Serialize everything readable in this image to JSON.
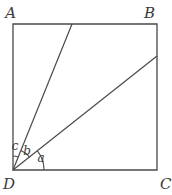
{
  "figure": {
    "kind": "plane-geometry-figure",
    "background_color": "#ffffff",
    "stroke_color": "#4a4a4a",
    "label_color": "#3a3a3a",
    "square": {
      "name": "square-abcd",
      "corners": {
        "A": {
          "x": 13,
          "y": 24
        },
        "B": {
          "x": 157,
          "y": 24
        },
        "C": {
          "x": 157,
          "y": 170
        },
        "D": {
          "x": 13,
          "y": 170
        }
      }
    },
    "vertex_labels": [
      {
        "key": "A",
        "text": "A",
        "x": 16,
        "y": 18,
        "anchor": "end"
      },
      {
        "key": "B",
        "text": "B",
        "x": 155,
        "y": 18,
        "anchor": "end"
      },
      {
        "key": "C",
        "text": "C",
        "x": 160,
        "y": 189,
        "anchor": "start"
      },
      {
        "key": "D",
        "text": "D",
        "x": 15,
        "y": 189,
        "anchor": "end"
      }
    ],
    "rays": [
      {
        "name": "ray-d-to-top-edge",
        "from": {
          "x": 13,
          "y": 170
        },
        "to": {
          "x": 72,
          "y": 24
        }
      },
      {
        "name": "ray-d-to-right-edge",
        "from": {
          "x": 13,
          "y": 170
        },
        "to": {
          "x": 157,
          "y": 56
        }
      }
    ],
    "angles": [
      {
        "key": "a",
        "text": "a",
        "name": "angle-a",
        "description": "angle between side DC and the ray from D to the right edge",
        "radius": 31,
        "start_deg": 0,
        "end_deg": 38,
        "label": {
          "x": 41,
          "y": 162
        }
      },
      {
        "key": "b",
        "text": "b",
        "name": "angle-b",
        "description": "angle between the two rays drawn from D",
        "radius": 21,
        "start_deg": 38,
        "end_deg": 68,
        "label": {
          "x": 27,
          "y": 155
        }
      },
      {
        "key": "c",
        "text": "c",
        "name": "angle-c",
        "description": "angle between the steep ray from D and side DA",
        "radius": 14,
        "start_deg": 68,
        "end_deg": 90,
        "label": {
          "x": 15,
          "y": 150
        }
      }
    ]
  }
}
